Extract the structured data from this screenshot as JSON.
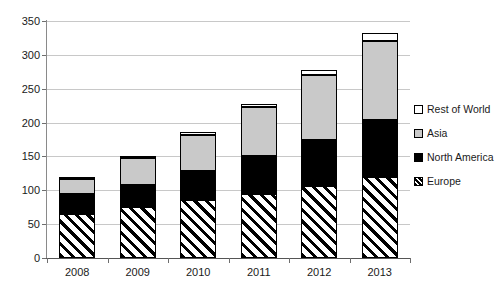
{
  "chart_data": {
    "type": "bar",
    "stacked": true,
    "title": "",
    "subtitle": "",
    "xlabel": "",
    "ylabel": "",
    "categories": [
      "2008",
      "2009",
      "2010",
      "2011",
      "2012",
      "2013"
    ],
    "series": [
      {
        "name": "Europe",
        "values": [
          65,
          76,
          86,
          95,
          107,
          120
        ],
        "color": "#000000",
        "fill": "diagonal-hatch"
      },
      {
        "name": "North America",
        "values": [
          30,
          32,
          43,
          55,
          67,
          84
        ],
        "color": "#000000",
        "fill": "solid-black"
      },
      {
        "name": "Asia",
        "values": [
          22,
          40,
          53,
          73,
          97,
          116
        ],
        "color": "#c9c9c9",
        "fill": "light-gray"
      },
      {
        "name": "Rest of World",
        "values": [
          3,
          3,
          4,
          5,
          6,
          13
        ],
        "color": "#ffffff",
        "fill": "white"
      }
    ],
    "totals": [
      120,
      151,
      186,
      228,
      277,
      333
    ],
    "ylim": [
      0,
      350
    ],
    "ytick_labels": [
      "0",
      "50",
      "100",
      "150",
      "200",
      "250",
      "300",
      "350"
    ],
    "ytick_values": [
      0,
      50,
      100,
      150,
      200,
      250,
      300,
      350
    ],
    "grid": true,
    "grid_axis": "y",
    "legend_position": "right",
    "legend_order": [
      "Rest of World",
      "Asia",
      "North America",
      "Europe"
    ]
  },
  "legend": {
    "items": [
      {
        "label": "Rest of World",
        "swatch": "white-square-icon"
      },
      {
        "label": "Asia",
        "swatch": "gray-square-icon"
      },
      {
        "label": "North America",
        "swatch": "black-square-icon"
      },
      {
        "label": "Europe",
        "swatch": "hatched-square-icon"
      }
    ]
  },
  "colors": {
    "asia": "#c9c9c9",
    "north_america": "#000000",
    "rest_of_world": "#ffffff",
    "europe_hatch": "#000000",
    "gridline": "#c8c8c8",
    "axis": "#555555",
    "background": "#ffffff"
  }
}
